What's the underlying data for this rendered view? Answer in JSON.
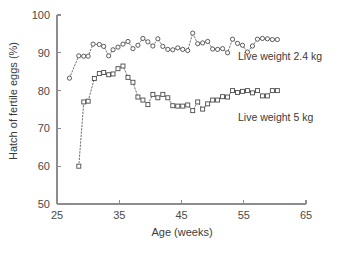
{
  "chart_data": {
    "type": "scatter",
    "title": "",
    "xlabel": "Age (weeks)",
    "ylabel": "Hatch of fertile eggs (%)",
    "xlim": [
      25,
      65
    ],
    "ylim": [
      50,
      100
    ],
    "xticks": [
      25,
      35,
      45,
      55,
      65
    ],
    "yticks": [
      50,
      60,
      70,
      80,
      90,
      100
    ],
    "grid": false,
    "legend_position": "inline-right",
    "series": [
      {
        "name": "Live weight 2.4 kg",
        "marker": "circle",
        "label_text": "Live weight 2.4 kg",
        "x": [
          27.0,
          28.5,
          29.3,
          30.0,
          30.8,
          31.8,
          32.5,
          33.3,
          34.0,
          34.8,
          35.6,
          36.4,
          37.2,
          38.0,
          38.8,
          39.6,
          40.4,
          41.2,
          42.0,
          42.8,
          43.6,
          44.4,
          45.2,
          46.0,
          46.8,
          47.6,
          48.4,
          49.2,
          50.0,
          50.8,
          51.6,
          52.4,
          53.2,
          54.0,
          54.8,
          55.6,
          56.4,
          57.2,
          58.0,
          58.8,
          59.6,
          60.4
        ],
        "y": [
          83.3,
          89.2,
          89.1,
          89.1,
          92.3,
          92.2,
          91.7,
          89.2,
          90.8,
          91.5,
          92.3,
          93.0,
          91.1,
          92.0,
          93.8,
          92.9,
          91.8,
          93.7,
          91.7,
          90.9,
          90.8,
          91.3,
          90.9,
          90.6,
          95.2,
          92.4,
          92.6,
          93.0,
          91.0,
          90.9,
          91.1,
          90.0,
          93.6,
          92.5,
          92.0,
          90.2,
          91.8,
          93.6,
          93.8,
          93.7,
          93.5,
          93.5
        ]
      },
      {
        "name": "Live weight 5 kg",
        "marker": "square",
        "label_text": "Live weight 5 kg",
        "x": [
          28.5,
          29.3,
          30.0,
          31.0,
          31.8,
          32.5,
          33.3,
          34.0,
          34.8,
          35.6,
          36.4,
          37.2,
          38.0,
          38.8,
          39.6,
          40.4,
          41.2,
          42.0,
          42.8,
          43.6,
          44.4,
          45.2,
          46.0,
          46.8,
          47.6,
          48.4,
          49.2,
          50.0,
          50.8,
          51.6,
          52.4,
          53.2,
          54.0,
          54.8,
          55.6,
          56.4,
          57.2,
          58.0,
          58.8,
          59.6,
          60.4
        ],
        "y": [
          60.0,
          77.0,
          77.2,
          83.2,
          84.5,
          84.8,
          84.2,
          84.4,
          85.8,
          86.5,
          83.5,
          82.2,
          78.3,
          77.5,
          76.3,
          79.0,
          78.1,
          79.0,
          78.1,
          76.0,
          75.9,
          75.9,
          76.2,
          74.7,
          77.0,
          75.1,
          76.5,
          77.5,
          77.5,
          78.4,
          78.3,
          80.0,
          79.5,
          79.8,
          80.0,
          79.4,
          80.0,
          78.6,
          78.6,
          80.0,
          80.0
        ]
      }
    ]
  },
  "axes": {
    "x_title": "Age (weeks)",
    "y_title": "Hatch of fertile eggs (%)",
    "x_tick_labels": [
      "25",
      "35",
      "45",
      "55",
      "65"
    ],
    "y_tick_labels": [
      "100",
      "90",
      "80",
      "70",
      "60",
      "50"
    ]
  },
  "labels": {
    "series_1": "Live weight 2.4 kg",
    "series_2": "Live weight 5 kg"
  },
  "colors": {
    "axis": "#8d8d8d",
    "text": "#3a3a3a",
    "marker_stroke": "#4a4a4a",
    "connector": "#5d5d5d",
    "background": "#ffffff"
  }
}
